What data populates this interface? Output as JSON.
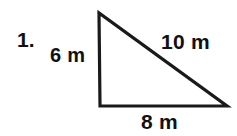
{
  "figure": {
    "problem_number": "1.",
    "shape": "right-triangle",
    "stroke_color": "#1a1a1a",
    "background_color": "#ffffff",
    "unit": "m",
    "vertices": {
      "top": [
        99,
        13
      ],
      "bottom_left": [
        100,
        106
      ],
      "bottom_right": [
        227,
        106
      ]
    },
    "sides": {
      "vertical_leg": {
        "label": "6 m",
        "value": 6,
        "position": "left"
      },
      "base_leg": {
        "label": "8 m",
        "value": 8,
        "position": "bottom"
      },
      "hypotenuse": {
        "label": "10 m",
        "value": 10,
        "position": "upper-right"
      }
    }
  }
}
